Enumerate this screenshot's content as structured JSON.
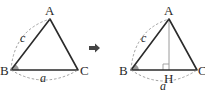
{
  "diagram": {
    "left_triangle": {
      "vertices": {
        "A": "A",
        "B": "B",
        "C": "C"
      },
      "sides": {
        "c": "c",
        "a": "a"
      },
      "angle_marked": "B"
    },
    "arrow": "right-arrow",
    "right_triangle": {
      "vertices": {
        "A": "A",
        "B": "B",
        "C": "C",
        "H": "H"
      },
      "sides": {
        "c": "c",
        "a": "a"
      },
      "angle_marked": "B",
      "altitude": "AH",
      "right_angle_at": "H"
    },
    "colors": {
      "line": "#2b2b2b",
      "dashed": "#8a8a8a",
      "angle_fill": "#9a9a9a",
      "altitude": "#9a9a9a"
    }
  }
}
